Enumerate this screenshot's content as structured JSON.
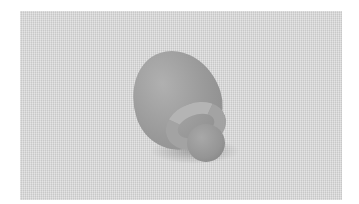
{
  "image": {
    "description": "Grayscale 3D render of an egg-shaped blob with a torus ring and small sphere resting on a textured gray surface",
    "background_color": "#d6d6d6",
    "object_color": "#9a9a9a",
    "objects": [
      {
        "name": "egg-blob",
        "color": "#a0a0a0"
      },
      {
        "name": "torus-ring",
        "color": "#a8a8a8"
      },
      {
        "name": "small-sphere",
        "color": "#959595"
      }
    ]
  }
}
